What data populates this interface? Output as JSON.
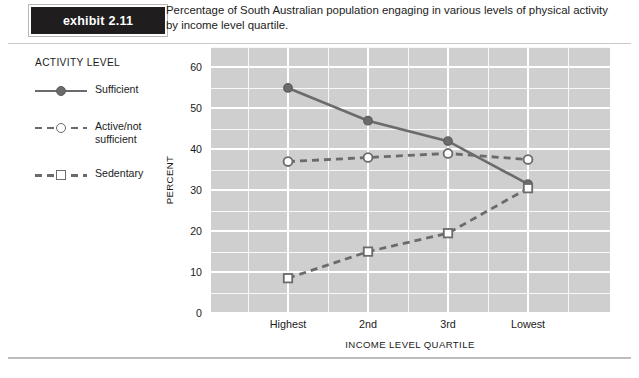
{
  "exhibit": {
    "word": "exhibit",
    "number": "2.11"
  },
  "caption": "Percentage of South Australian population engaging in various levels of physical activity by income level quartile.",
  "legend": {
    "title": "ACTIVITY LEVEL",
    "items": [
      {
        "label": "Sufficient",
        "style": "solid",
        "marker": "filled-circle",
        "color": "#6b6b6b"
      },
      {
        "label": "Active/not sufficient",
        "style": "dashed",
        "marker": "open-circle",
        "color": "#6b6b6b"
      },
      {
        "label": "Sedentary",
        "style": "dashed",
        "marker": "open-square",
        "color": "#6b6b6b"
      }
    ]
  },
  "chart_data": {
    "type": "line",
    "title": "Percentage of South Australian population engaging in various levels of physical activity by income level quartile.",
    "xlabel": "INCOME LEVEL QUARTILE",
    "ylabel": "PERCENT",
    "categories": [
      "Highest",
      "2nd",
      "3rd",
      "Lowest"
    ],
    "ylim": [
      0,
      65
    ],
    "yticks": [
      0,
      10,
      20,
      30,
      40,
      50,
      60
    ],
    "ytick_labels": [
      "0",
      "10",
      "20",
      "30",
      "40",
      "50",
      "60"
    ],
    "minor_tick_step": 5,
    "grid": true,
    "grid_color": "#ffffff",
    "plot_background": "#cfcfcf",
    "legend_position": "left-outside",
    "series": [
      {
        "name": "Sufficient",
        "values": [
          55,
          47,
          42,
          31.5
        ],
        "style": "solid",
        "marker": "filled-circle",
        "color": "#6b6b6b"
      },
      {
        "name": "Active/not sufficient",
        "values": [
          37,
          38,
          39,
          37.5
        ],
        "style": "dashed",
        "marker": "open-circle",
        "color": "#6b6b6b"
      },
      {
        "name": "Sedentary",
        "values": [
          8.5,
          15,
          19.5,
          30.5
        ],
        "style": "dashed",
        "marker": "open-square",
        "color": "#6b6b6b"
      }
    ]
  }
}
